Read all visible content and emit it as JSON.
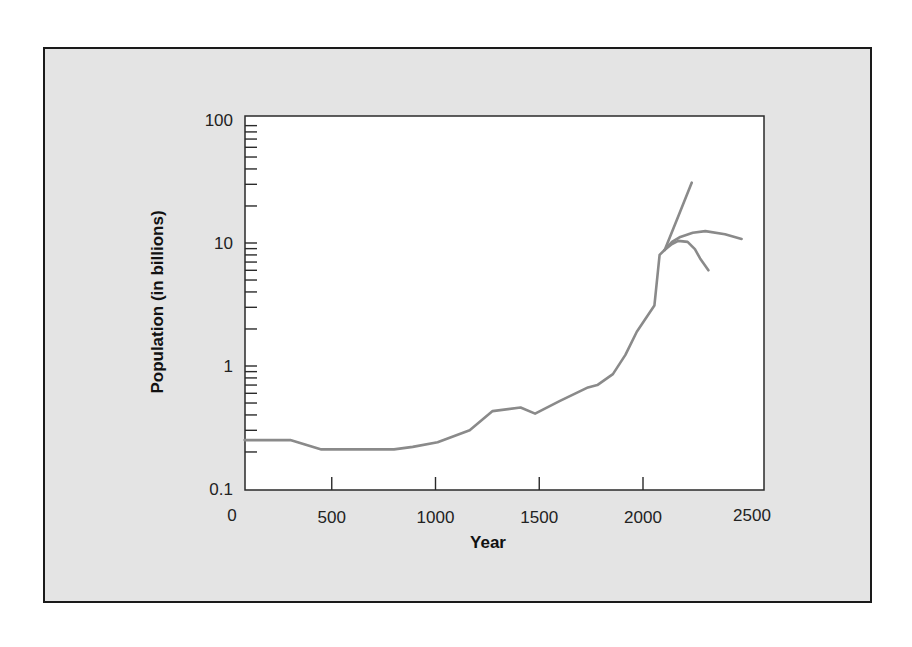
{
  "chart_data": {
    "type": "line",
    "title": "",
    "xlabel": "Year",
    "ylabel": "Population (in billions)",
    "xlim": [
      0,
      2500
    ],
    "ylim": [
      0.1,
      100
    ],
    "yscale": "log",
    "grid": false,
    "legend": null,
    "x_ticks": [
      "0",
      "500",
      "1000",
      "1500",
      "2000",
      "2500"
    ],
    "y_ticks": [
      "0.1",
      "1",
      "10",
      "100"
    ],
    "line_color": "#8a8a8a",
    "series": [
      {
        "name": "Historical population",
        "x": [
          80,
          300,
          450,
          800,
          890,
          1010,
          1165,
          1275,
          1410,
          1480,
          1600,
          1735,
          1780,
          1855,
          1915,
          1970,
          2055,
          2080,
          2105
        ],
        "values": [
          0.25,
          0.25,
          0.21,
          0.21,
          0.22,
          0.24,
          0.3,
          0.43,
          0.46,
          0.41,
          0.52,
          0.67,
          0.7,
          0.86,
          1.23,
          1.9,
          3.1,
          8.0,
          8.8
        ]
      },
      {
        "name": "High projection",
        "x": [
          2105,
          2170,
          2235
        ],
        "values": [
          8.8,
          16.5,
          31
        ]
      },
      {
        "name": "Medium projection",
        "x": [
          2105,
          2140,
          2180,
          2240,
          2300,
          2395,
          2475
        ],
        "values": [
          8.8,
          10.2,
          11.2,
          12.1,
          12.5,
          11.8,
          10.8
        ]
      },
      {
        "name": "Low projection",
        "x": [
          2105,
          2140,
          2170,
          2215,
          2250,
          2275,
          2315
        ],
        "values": [
          8.8,
          9.8,
          10.4,
          10.2,
          8.9,
          7.5,
          6.0
        ]
      }
    ]
  }
}
